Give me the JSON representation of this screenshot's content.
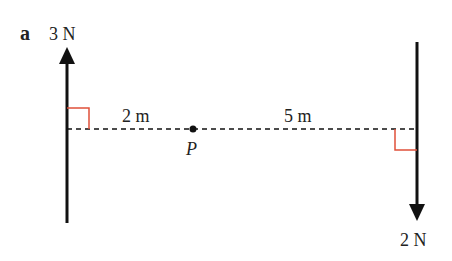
{
  "part_label": "a",
  "forces": [
    {
      "id": "left",
      "magnitude_label": "3 N",
      "direction": "up"
    },
    {
      "id": "right",
      "magnitude_label": "2 N",
      "direction": "down"
    }
  ],
  "distances": [
    {
      "label": "2 m",
      "between": "left force and P"
    },
    {
      "label": "5 m",
      "between": "P and right force"
    }
  ],
  "point": {
    "label": "P"
  },
  "colors": {
    "line": "#111111",
    "right_angle_marker": "#e0503a",
    "text": "#222222"
  }
}
